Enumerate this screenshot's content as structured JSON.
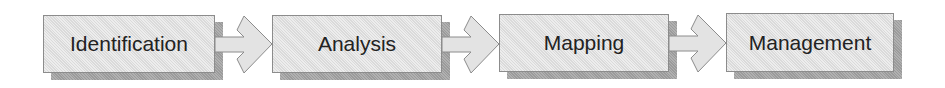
{
  "diagram": {
    "type": "process-flow",
    "direction": "left-to-right",
    "steps": [
      {
        "label": "Identification"
      },
      {
        "label": "Analysis"
      },
      {
        "label": "Mapping"
      },
      {
        "label": "Management"
      }
    ],
    "connectors": [
      {
        "from": "Identification",
        "to": "Analysis",
        "shape": "block-arrow"
      },
      {
        "from": "Analysis",
        "to": "Mapping",
        "shape": "block-arrow"
      },
      {
        "from": "Mapping",
        "to": "Management",
        "shape": "block-arrow"
      }
    ],
    "colors": {
      "box_fill": "#e3e3e3",
      "box_border": "#8c8c8c",
      "shadow": "#a3a3a3",
      "text": "#222222",
      "arrow_fill": "#e3e3e3",
      "arrow_stroke": "#8c8c8c"
    }
  }
}
